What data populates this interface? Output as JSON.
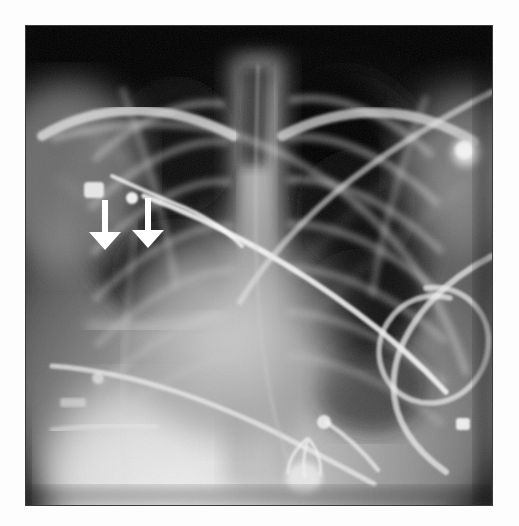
{
  "page": {
    "background_color": "#fdfdfd",
    "width": 519,
    "height": 526
  },
  "figure": {
    "type": "radiograph",
    "modality": "X-ray",
    "view": "anteroposterior portable chest radiograph",
    "title": "",
    "caption": "",
    "border_color": "#3a3a3a",
    "image_region": {
      "x": 26,
      "y": 26,
      "width": 466,
      "height": 479
    }
  },
  "annotations": {
    "color": "#ffffff",
    "items": [
      {
        "name": "arrow-1",
        "shape": "down-arrow",
        "label": "",
        "tail_x": 105,
        "tail_y": 200,
        "tip_x": 105,
        "tip_y": 250
      },
      {
        "name": "arrow-2",
        "shape": "down-arrow",
        "label": "",
        "tail_x": 148,
        "tail_y": 198,
        "tip_x": 148,
        "tip_y": 248
      }
    ]
  },
  "radiograph_features": {
    "lung_fields": [
      "right upper lung",
      "right lower lung",
      "left upper lung",
      "left lower lung"
    ],
    "devices": [
      "central venous catheter",
      "ecg-lead-wires",
      "ecg-electrode-snaps",
      "oxygen-tubing",
      "nasogastric-tube"
    ],
    "bright_opacities": [
      "right shoulder nodular opacity",
      "left hemidiaphragm dense region"
    ],
    "tone": {
      "darkest": "#050505",
      "lung": "#1d1d1d",
      "soft_tissue": "#8d8d8d",
      "dense": "#e8e8e8"
    }
  }
}
